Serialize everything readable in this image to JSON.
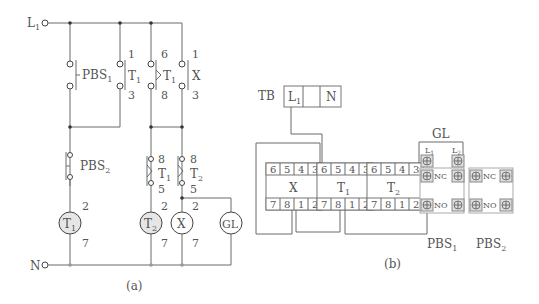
{
  "diagram_a": {
    "caption": "(a)",
    "supply": {
      "line": "L",
      "line_sub": "1",
      "neutral": "N"
    },
    "contacts": [
      {
        "name": "PBS",
        "sub": "1",
        "type": "pushbutton-NO"
      },
      {
        "name": "T",
        "sub": "1",
        "top": "1",
        "bottom": "3",
        "type": "NO"
      },
      {
        "name": "T",
        "sub": "1",
        "top": "6",
        "bottom": "8",
        "type": "timed-NO"
      },
      {
        "name": "X",
        "sub": "",
        "top": "1",
        "bottom": "3",
        "type": "NO"
      },
      {
        "name": "PBS",
        "sub": "2",
        "type": "pushbutton-NC"
      },
      {
        "name": "T",
        "sub": "1",
        "top": "8",
        "bottom": "5",
        "type": "timed-NC"
      },
      {
        "name": "T",
        "sub": "2",
        "top": "8",
        "bottom": "5",
        "type": "timed-NC"
      }
    ],
    "coils": [
      {
        "name": "T",
        "sub": "1",
        "top": "2",
        "bottom": "7"
      },
      {
        "name": "T",
        "sub": "2",
        "top": "2",
        "bottom": "7"
      },
      {
        "name": "X",
        "sub": "",
        "top": "2",
        "bottom": "7"
      },
      {
        "name": "GL",
        "sub": ""
      }
    ]
  },
  "diagram_b": {
    "caption": "(b)",
    "terminal_block": {
      "label": "TB",
      "cells": [
        "L1",
        "",
        "N"
      ]
    },
    "relays": [
      {
        "name": "X",
        "sub": "",
        "top_pins": [
          "6",
          "5",
          "4",
          "3"
        ],
        "bottom_pins": [
          "7",
          "8",
          "1",
          "2"
        ]
      },
      {
        "name": "T",
        "sub": "1",
        "top_pins": [
          "6",
          "5",
          "4",
          "3"
        ],
        "bottom_pins": [
          "7",
          "8",
          "1",
          "2"
        ]
      },
      {
        "name": "T",
        "sub": "2",
        "top_pins": [
          "6",
          "5",
          "4",
          "3"
        ],
        "bottom_pins": [
          "7",
          "8",
          "1",
          "2"
        ]
      }
    ],
    "lamp": {
      "label": "GL",
      "terminals": [
        "L1",
        "L2"
      ]
    },
    "pushbuttons": [
      {
        "label": "PBS1",
        "contacts": [
          "NC",
          "NO"
        ]
      },
      {
        "label": "PBS2",
        "contacts": [
          "NC",
          "NO"
        ]
      }
    ]
  }
}
